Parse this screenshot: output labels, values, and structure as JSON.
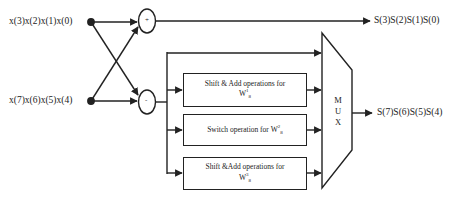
{
  "diagram": {
    "inputs": {
      "top": "x(3)x(2)x(1)x(0)",
      "bottom": "x(7)x(6)x(5)x(4)"
    },
    "adders": {
      "top_sign": "+",
      "bottom_sign": "-"
    },
    "blocks": [
      {
        "text": "Shift & Add operations for",
        "w_base": "W",
        "w_sup": "1",
        "w_sub": "8"
      },
      {
        "text": "Switch operation for",
        "w_base": "W",
        "w_sup": "2",
        "w_sub": "8"
      },
      {
        "text": "Shift &Add operations for",
        "w_base": "W",
        "w_sup": "3",
        "w_sub": "8"
      }
    ],
    "mux": {
      "letters": [
        "M",
        "U",
        "X"
      ]
    },
    "outputs": {
      "top": "S(3)S(2)S(1)S(0)",
      "bottom": "S(7)S(6)S(5)S(4)"
    },
    "colors": {
      "line": "#222222",
      "background": "#ffffff"
    }
  }
}
